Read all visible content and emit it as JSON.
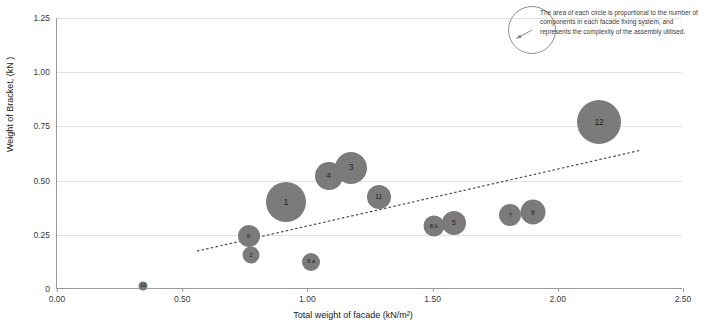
{
  "chart_data": {
    "type": "scatter",
    "title": "",
    "xlabel": "Total weight of facade (kN/m²)",
    "ylabel": "Weight of Bracket, (kN )",
    "xlim": [
      0.0,
      2.5
    ],
    "ylim": [
      0.0,
      1.25
    ],
    "xticks": [
      "0.00",
      "0.50",
      "1.00",
      "1.50",
      "2.00",
      "2.50"
    ],
    "yticks": [
      "0",
      "0.25",
      "0.50",
      "0.75",
      "1.00",
      "1.25"
    ],
    "grid": true,
    "legend": "none",
    "bubble_color": "#7b7b7b",
    "points": [
      {
        "label": "10",
        "x": 0.345,
        "y": 0.015,
        "size": 9
      },
      {
        "label": "2",
        "x": 0.775,
        "y": 0.155,
        "size": 17
      },
      {
        "label": "6",
        "x": 0.765,
        "y": 0.245,
        "size": 22
      },
      {
        "label": "1",
        "x": 0.915,
        "y": 0.4,
        "size": 40
      },
      {
        "label": "8.a",
        "x": 1.015,
        "y": 0.125,
        "size": 18
      },
      {
        "label": "4",
        "x": 1.085,
        "y": 0.52,
        "size": 28
      },
      {
        "label": "3",
        "x": 1.175,
        "y": 0.56,
        "size": 32
      },
      {
        "label": "11",
        "x": 1.285,
        "y": 0.425,
        "size": 24
      },
      {
        "label": "8.b",
        "x": 1.505,
        "y": 0.29,
        "size": 21
      },
      {
        "label": "5",
        "x": 1.585,
        "y": 0.305,
        "size": 24
      },
      {
        "label": "7",
        "x": 1.81,
        "y": 0.34,
        "size": 22
      },
      {
        "label": "9",
        "x": 1.9,
        "y": 0.355,
        "size": 25
      },
      {
        "label": "12",
        "x": 2.165,
        "y": 0.77,
        "size": 44
      }
    ],
    "trendline": {
      "style": "dotted",
      "x0": 0.56,
      "y0": 0.175,
      "x1": 2.33,
      "y1": 0.64
    }
  },
  "annotation": {
    "text": "The area of each circle is proportional to the number of components in each facade fixing system, and represents the complexity of the assembly utilised."
  }
}
